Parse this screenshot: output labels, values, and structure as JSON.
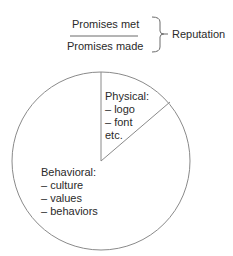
{
  "formula": {
    "numerator": "Promises met",
    "denominator": "Promises made",
    "result": "Reputation"
  },
  "pie": {
    "slices": [
      {
        "title": "Physical:",
        "items": [
          "– logo",
          "– font",
          "etc."
        ]
      },
      {
        "title": "Behavioral:",
        "items": [
          "– culture",
          "– values",
          "– behaviors"
        ]
      }
    ]
  },
  "colors": {
    "stroke": "#6b6b6b",
    "text": "#2a2a2a",
    "background": "#ffffff"
  }
}
